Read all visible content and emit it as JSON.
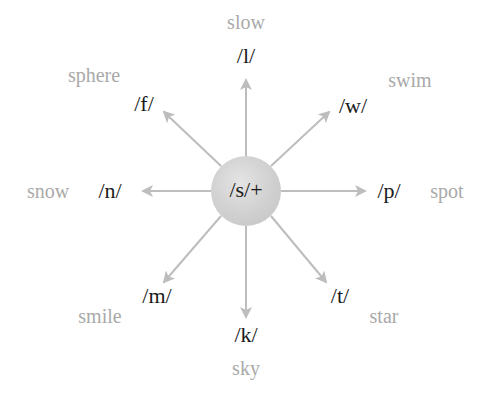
{
  "diagram": {
    "type": "radial-blend-diagram",
    "center": {
      "label": "/s/+",
      "fill_color": "#d0d0d0"
    },
    "arrow_color": "#bdbdbd",
    "phoneme_color": "#1a1a1a",
    "word_color": "#a9a9a9",
    "spokes": [
      {
        "direction": "north",
        "phoneme": "/l/",
        "word": "slow"
      },
      {
        "direction": "northeast",
        "phoneme": "/w/",
        "word": "swim"
      },
      {
        "direction": "east",
        "phoneme": "/p/",
        "word": "spot"
      },
      {
        "direction": "southeast",
        "phoneme": "/t/",
        "word": "star"
      },
      {
        "direction": "south",
        "phoneme": "/k/",
        "word": "sky"
      },
      {
        "direction": "southwest",
        "phoneme": "/m/",
        "word": "smile"
      },
      {
        "direction": "west",
        "phoneme": "/n/",
        "word": "snow"
      },
      {
        "direction": "northwest",
        "phoneme": "/f/",
        "word": "sphere"
      }
    ]
  }
}
